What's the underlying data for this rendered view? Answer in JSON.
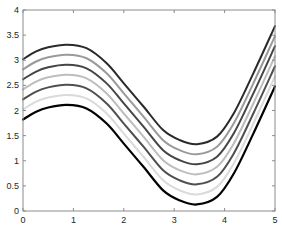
{
  "chart_data": {
    "type": "line",
    "title": "",
    "xlabel": "",
    "ylabel": "",
    "xlim": [
      0,
      5
    ],
    "ylim": [
      0,
      4
    ],
    "grid": false,
    "legend": null,
    "x_ticks": [
      "0",
      "1",
      "2",
      "3",
      "4",
      "5"
    ],
    "y_ticks": [
      "0",
      "0.5",
      "1",
      "1.5",
      "2",
      "2.5",
      "3",
      "3.5",
      "4"
    ],
    "x": [
      0,
      0.25,
      0.5,
      0.87,
      1.26,
      1.66,
      2.0,
      2.39,
      2.78,
      3.11,
      3.45,
      3.85,
      4.18,
      4.57,
      5.0
    ],
    "base_curve": [
      3.02,
      3.17,
      3.26,
      3.31,
      3.24,
      2.94,
      2.54,
      2.08,
      1.61,
      1.41,
      1.33,
      1.48,
      1.94,
      2.74,
      3.68
    ],
    "series": [
      {
        "name": "curve-1",
        "offset": 0.0,
        "color": "#2a2a2a",
        "width": 2.0
      },
      {
        "name": "curve-2",
        "offset": -0.2,
        "color": "#9a9a9a",
        "width": 2.0
      },
      {
        "name": "curve-3",
        "offset": -0.4,
        "color": "#454545",
        "width": 2.0
      },
      {
        "name": "curve-4",
        "offset": -0.6,
        "color": "#bdbdbd",
        "width": 2.0
      },
      {
        "name": "curve-5",
        "offset": -0.8,
        "color": "#4f4f4f",
        "width": 2.0
      },
      {
        "name": "curve-6",
        "offset": -1.0,
        "color": "#dadada",
        "width": 2.0
      },
      {
        "name": "curve-7",
        "offset": -1.2,
        "color": "#000000",
        "width": 2.2
      }
    ],
    "axis_color": "#8c8c8c"
  }
}
